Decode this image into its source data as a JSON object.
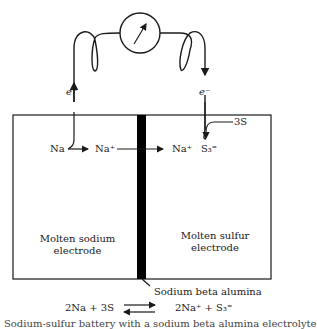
{
  "diagram": {
    "meter": {
      "icon": "galvanometer-icon"
    },
    "electron_labels": {
      "left": "e⁻",
      "right": "e⁻"
    },
    "reaction_labels": {
      "na": "Na",
      "na_plus_left": "Na⁺",
      "na_plus_right": "Na⁺",
      "three_s": "3S",
      "s3": "S₃⁼"
    },
    "electrodes": {
      "left": [
        "Molten sodium",
        "electrode"
      ],
      "right": [
        "Molten sulfur",
        "electrode"
      ]
    },
    "membrane_label": "Sodium beta alumina",
    "equation": {
      "reactants": "2Na + 3S",
      "products": "2Na⁺ + S₃⁼"
    },
    "caption": "Sodium-sulfur battery with a sodium beta alumina electrolyte"
  },
  "colors": {
    "line": "#1a1a1a",
    "membrane": "#000000",
    "background": "#ffffff"
  }
}
